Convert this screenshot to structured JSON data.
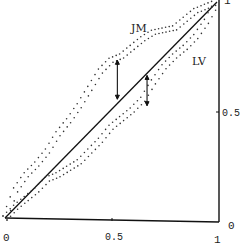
{
  "chart_data": {
    "type": "line",
    "title": "",
    "xlabel": "",
    "ylabel": "",
    "xlim": [
      0,
      1
    ],
    "ylim": [
      0,
      1
    ],
    "grid": false,
    "x_ticks": [
      "0",
      "0.5",
      "1"
    ],
    "y_ticks": [
      "0",
      "0.5",
      "1"
    ],
    "legend_position": "inline labels",
    "series": [
      {
        "name": "diagonal",
        "style": "solid",
        "x": [
          0,
          1
        ],
        "y": [
          0,
          1
        ]
      },
      {
        "name": "JM",
        "style": "dotted",
        "x": [
          0.0,
          0.05,
          0.1,
          0.15,
          0.2,
          0.25,
          0.3,
          0.35,
          0.4,
          0.45,
          0.5,
          0.55,
          0.6,
          0.65,
          0.7,
          0.75,
          0.8,
          0.85,
          0.9,
          0.95,
          1.0
        ],
        "y": [
          0.0,
          0.13,
          0.2,
          0.25,
          0.31,
          0.39,
          0.45,
          0.52,
          0.6,
          0.68,
          0.73,
          0.75,
          0.79,
          0.83,
          0.86,
          0.87,
          0.88,
          0.92,
          0.96,
          0.98,
          1.0
        ]
      },
      {
        "name": "LV",
        "style": "dotted",
        "x": [
          0.0,
          0.05,
          0.1,
          0.15,
          0.2,
          0.25,
          0.3,
          0.35,
          0.4,
          0.45,
          0.5,
          0.55,
          0.6,
          0.65,
          0.7,
          0.75,
          0.8,
          0.85,
          0.9,
          0.95,
          1.0
        ],
        "y": [
          0.0,
          0.05,
          0.09,
          0.13,
          0.18,
          0.2,
          0.23,
          0.26,
          0.31,
          0.36,
          0.42,
          0.46,
          0.5,
          0.55,
          0.63,
          0.7,
          0.75,
          0.79,
          0.84,
          0.91,
          1.0
        ]
      }
    ],
    "annotations": [
      {
        "type": "double-arrow",
        "x": 0.53,
        "y_from": 0.55,
        "y_to": 0.73,
        "label": "JM gap"
      },
      {
        "type": "double-arrow",
        "x": 0.67,
        "y_from": 0.52,
        "y_to": 0.66,
        "label": "LV gap"
      },
      {
        "type": "text",
        "text": "JM",
        "x": 0.63,
        "y": 0.88
      },
      {
        "type": "text",
        "text": "LV",
        "x": 0.88,
        "y": 0.72
      }
    ]
  },
  "labels": {
    "x_tick_0": "0",
    "x_tick_half": "0.5",
    "x_tick_1": "1",
    "y_tick_0": "0",
    "y_tick_half": "0.5",
    "y_tick_1": "1",
    "series_jm": "JM",
    "series_lv": "LV"
  }
}
